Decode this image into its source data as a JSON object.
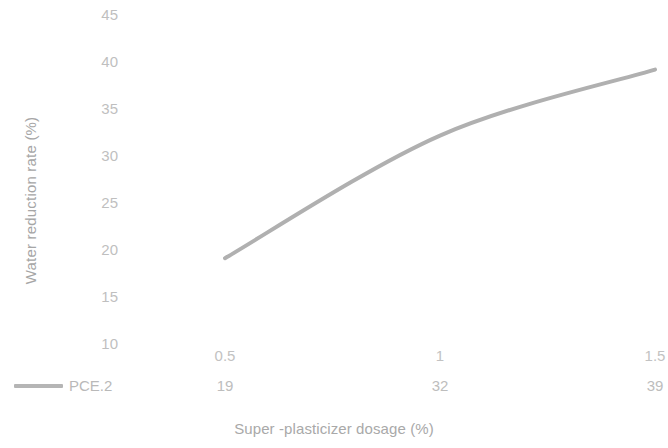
{
  "chart_data": {
    "type": "line",
    "title": "",
    "xlabel": "Super -plasticizer dosage (%)",
    "ylabel": "Water reduction rate (%)",
    "categories": [
      "0.5",
      "1",
      "1.5"
    ],
    "x_tick_labels": [
      "0.5",
      "1",
      "1.5"
    ],
    "y_tick_labels": [
      "45",
      "40",
      "35",
      "30",
      "25",
      "20",
      "15",
      "10"
    ],
    "ylim": [
      10,
      45
    ],
    "y_tick_step": 5,
    "grid": false,
    "legend_position": "bottom-left",
    "data_table_row_label": "PCE.2",
    "series": [
      {
        "name": "PCE.2",
        "values": [
          19,
          32,
          39
        ],
        "value_labels": [
          "19",
          "32",
          "39"
        ],
        "color": "#b0b0b0"
      }
    ]
  },
  "legend": {
    "entries": [
      {
        "label": "PCE.2",
        "color": "#b5b5b5"
      }
    ]
  },
  "axes": {
    "y_title": "Water reduction rate (%)",
    "x_title": "Super -plasticizer dosage (%)"
  },
  "colors": {
    "line": "#b0b0b0",
    "tick_text": "#bfbfbf",
    "axis_title_text": "#a6a6a6",
    "background": "#ffffff"
  }
}
